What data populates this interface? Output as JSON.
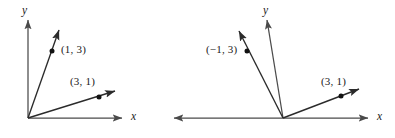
{
  "figure": {
    "background_color": "#ffffff",
    "stroke_color": "#2b2b2b",
    "axis_color": "#4a4a4a",
    "text_color": "#1a1a1a",
    "width": 395,
    "height": 138
  },
  "panels": [
    {
      "id": "left-panel",
      "name": "left-diagram",
      "origin": {
        "x": 28,
        "y": 118
      },
      "axes": {
        "x": {
          "label": "x",
          "label_pos": {
            "x": 131,
            "y": 113
          },
          "start": {
            "x": 28,
            "y": 118
          },
          "end": {
            "x": 122,
            "y": 118
          },
          "arrow_start": false,
          "arrow_end": true
        },
        "y": {
          "label": "y",
          "label_pos": {
            "x": 22,
            "y": 6
          },
          "start": {
            "x": 28,
            "y": 118
          },
          "end": {
            "x": 28,
            "y": 20
          },
          "arrow_start": false,
          "arrow_end": true
        }
      },
      "vectors": [
        {
          "name": "vector-1-3",
          "label": "(1, 3)",
          "label_pos": {
            "x": 61,
            "y": 44
          },
          "tip": {
            "x": 59,
            "y": 30
          },
          "dot": {
            "x": 52,
            "y": 51
          }
        },
        {
          "name": "vector-3-1",
          "label": "(3, 1)",
          "label_pos": {
            "x": 70,
            "y": 76
          },
          "tip": {
            "x": 115,
            "y": 91
          },
          "dot": {
            "x": 99,
            "y": 97
          }
        }
      ]
    },
    {
      "id": "right-panel",
      "name": "right-diagram",
      "origin": {
        "x": 283,
        "y": 118
      },
      "axes": {
        "x": {
          "label": "x",
          "label_pos": {
            "x": 377,
            "y": 113
          },
          "start": {
            "x": 174,
            "y": 118
          },
          "end": {
            "x": 368,
            "y": 118
          },
          "arrow_start": true,
          "arrow_end": true
        },
        "y": {
          "label": "y",
          "label_pos": {
            "x": 263,
            "y": 6
          },
          "start": {
            "x": 283,
            "y": 118
          },
          "end": {
            "x": 267,
            "y": 20
          },
          "arrow_start": false,
          "arrow_end": true
        }
      },
      "vectors": [
        {
          "name": "vector-neg1-3",
          "label": "(−1, 3)",
          "label_pos": {
            "x": 207,
            "y": 44
          },
          "tip": {
            "x": 239,
            "y": 31
          },
          "dot": {
            "x": 247,
            "y": 51
          }
        },
        {
          "name": "vector-3-1",
          "label": "(3, 1)",
          "label_pos": {
            "x": 321,
            "y": 76
          },
          "tip": {
            "x": 359,
            "y": 89
          },
          "dot": {
            "x": 341,
            "y": 96
          }
        }
      ]
    }
  ]
}
